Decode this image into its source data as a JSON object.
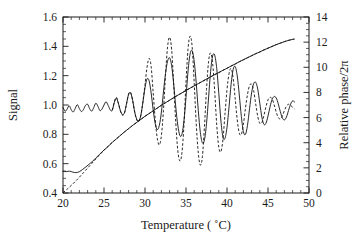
{
  "chart_data": {
    "type": "line",
    "title": "",
    "xlabel": "Temperature ( ˚C)",
    "ylabel": "Signal",
    "y2label": "Relative phase/2π",
    "xlim": [
      20,
      50
    ],
    "ylim": [
      0.4,
      1.6
    ],
    "y2lim": [
      0,
      14
    ],
    "xticks": [
      20,
      25,
      30,
      35,
      40,
      45,
      50
    ],
    "xtick_labels": [
      "20",
      "25",
      "30",
      "35",
      "40",
      "45",
      "50"
    ],
    "xminor_step": 1,
    "yticks": [
      0.4,
      0.6,
      0.8,
      1.0,
      1.2,
      1.4,
      1.6
    ],
    "ytick_labels": [
      "0.4",
      "0.6",
      "0.8",
      "1.0",
      "1.2",
      "1.4",
      "1.6"
    ],
    "yminor_step": 0.05,
    "y2ticks": [
      0,
      2,
      4,
      6,
      8,
      10,
      12,
      14
    ],
    "y2tick_labels": [
      "0",
      "2",
      "4",
      "6",
      "8",
      "10",
      "12",
      "14"
    ],
    "y2minor_step": 0.5,
    "grid": false,
    "legend": "none",
    "ticks_direction": "in",
    "series": [
      {
        "name": "signal-measured",
        "style": "solid",
        "axis": "left",
        "x": [
          20.0,
          20.25,
          20.5,
          20.75,
          21.0,
          21.25,
          21.5,
          21.75,
          22.0,
          22.25,
          22.5,
          22.75,
          23.0,
          23.25,
          23.5,
          23.75,
          24.0,
          24.25,
          24.5,
          24.75,
          25.0,
          25.25,
          25.5,
          25.75,
          26.0,
          26.25,
          26.5,
          26.75,
          27.0,
          27.25,
          27.5,
          27.75,
          28.0,
          28.25,
          28.5,
          28.75,
          29.0,
          29.25,
          29.5,
          29.75,
          30.0,
          30.25,
          30.5,
          30.75,
          31.0,
          31.25,
          31.5,
          31.75,
          32.0,
          32.25,
          32.5,
          32.75,
          33.0,
          33.25,
          33.5,
          33.75,
          34.0,
          34.25,
          34.5,
          34.75,
          35.0,
          35.25,
          35.5,
          35.75,
          36.0,
          36.25,
          36.5,
          36.75,
          37.0,
          37.25,
          37.5,
          37.75,
          38.0,
          38.25,
          38.5,
          38.75,
          39.0,
          39.25,
          39.5,
          39.75,
          40.0,
          40.25,
          40.5,
          40.75,
          41.0,
          41.25,
          41.5,
          41.75,
          42.0,
          42.25,
          42.5,
          42.75,
          43.0,
          43.25,
          43.5,
          43.75,
          44.0,
          44.25,
          44.5,
          44.75,
          45.0,
          45.25,
          45.5,
          45.75,
          46.0,
          46.25,
          46.5,
          46.75,
          47.0,
          47.25,
          47.5,
          47.75,
          48.0,
          48.25
        ],
        "y": [
          0.985,
          0.958,
          0.972,
          0.995,
          0.968,
          0.952,
          0.978,
          1.002,
          0.975,
          0.955,
          0.97,
          0.998,
          1.005,
          0.975,
          0.958,
          0.982,
          1.012,
          0.992,
          0.962,
          0.972,
          1.0,
          1.022,
          0.998,
          0.968,
          0.962,
          1.015,
          1.048,
          1.012,
          0.962,
          0.935,
          0.948,
          1.01,
          1.072,
          1.082,
          1.03,
          0.952,
          0.902,
          0.892,
          0.932,
          1.02,
          1.118,
          1.178,
          1.165,
          1.082,
          0.965,
          0.872,
          0.832,
          0.862,
          0.952,
          1.088,
          1.215,
          1.298,
          1.322,
          1.268,
          1.142,
          0.988,
          0.862,
          0.792,
          0.8,
          0.892,
          1.052,
          1.232,
          1.348,
          1.37,
          1.298,
          1.148,
          0.962,
          0.812,
          0.742,
          0.762,
          0.872,
          1.048,
          1.228,
          1.335,
          1.34,
          1.248,
          1.08,
          0.898,
          0.782,
          0.772,
          0.848,
          0.988,
          1.142,
          1.242,
          1.262,
          1.198,
          1.068,
          0.922,
          0.818,
          0.8,
          0.862,
          0.975,
          1.082,
          1.145,
          1.155,
          1.108,
          1.012,
          0.918,
          0.868,
          0.875,
          0.925,
          0.988,
          1.038,
          1.058,
          1.048,
          1.008,
          0.955,
          0.912,
          0.898,
          0.918,
          0.962,
          1.005,
          1.028,
          1.02
        ]
      },
      {
        "name": "signal-theory",
        "style": "dashed",
        "axis": "left",
        "x": [
          26.0,
          26.25,
          26.5,
          26.75,
          27.0,
          27.25,
          27.5,
          27.75,
          28.0,
          28.25,
          28.5,
          28.75,
          29.0,
          29.25,
          29.5,
          29.75,
          30.0,
          30.25,
          30.5,
          30.75,
          31.0,
          31.25,
          31.5,
          31.75,
          32.0,
          32.25,
          32.5,
          32.75,
          33.0,
          33.25,
          33.5,
          33.75,
          34.0,
          34.25,
          34.5,
          34.75,
          35.0,
          35.25,
          35.5,
          35.75,
          36.0,
          36.25,
          36.5,
          36.75,
          37.0,
          37.25,
          37.5,
          37.75,
          38.0,
          38.25,
          38.5,
          38.75,
          39.0,
          39.25,
          39.5,
          39.75,
          40.0,
          40.25,
          40.5,
          40.75,
          41.0,
          41.25,
          41.5,
          41.75,
          42.0,
          42.25,
          42.5,
          42.75,
          43.0,
          43.25,
          43.5,
          43.75,
          44.0,
          44.25,
          44.5,
          44.75,
          45.0,
          45.25,
          45.5,
          45.75,
          46.0,
          46.25,
          46.5,
          46.75,
          47.0,
          47.25,
          47.5,
          47.75,
          48.0,
          48.25
        ],
        "y": [
          0.965,
          1.018,
          1.052,
          1.012,
          0.958,
          0.93,
          0.945,
          1.008,
          1.075,
          1.085,
          1.028,
          0.948,
          0.898,
          0.888,
          0.93,
          1.025,
          1.138,
          1.258,
          1.318,
          1.262,
          1.082,
          0.898,
          0.772,
          0.728,
          0.792,
          0.962,
          1.2,
          1.395,
          1.462,
          1.378,
          1.142,
          0.882,
          0.69,
          0.618,
          0.672,
          0.862,
          1.155,
          1.385,
          1.47,
          1.398,
          1.152,
          0.872,
          0.672,
          0.59,
          0.648,
          0.852,
          1.105,
          1.295,
          1.355,
          1.282,
          1.095,
          0.862,
          0.712,
          0.682,
          0.762,
          0.935,
          1.105,
          1.215,
          1.248,
          1.182,
          1.042,
          0.898,
          0.808,
          0.8,
          0.868,
          0.978,
          1.072,
          1.132,
          1.142,
          1.098,
          1.008,
          0.922,
          0.875,
          0.88,
          0.928,
          0.988,
          1.035,
          1.052,
          1.042,
          1.002,
          0.952,
          0.915,
          0.905,
          0.925,
          0.962,
          0.992,
          1.005,
          0.998,
          0.985,
          0.972
        ]
      },
      {
        "name": "phase-measured",
        "style": "solid",
        "axis": "right",
        "x": [
          20.0,
          20.4,
          20.8,
          21.2,
          21.6,
          22.0,
          22.4,
          22.8,
          23.2,
          23.6,
          24.0,
          24.5,
          25.0,
          25.5,
          26.0,
          26.5,
          27.0,
          27.5,
          28.0,
          28.5,
          29.0,
          29.5,
          30.0,
          30.5,
          31.0,
          31.5,
          32.0,
          32.5,
          33.0,
          33.5,
          34.0,
          34.5,
          35.0,
          35.5,
          36.0,
          36.5,
          37.0,
          37.5,
          38.0,
          38.5,
          39.0,
          39.5,
          40.0,
          40.5,
          41.0,
          41.5,
          42.0,
          42.5,
          43.0,
          43.5,
          44.0,
          44.5,
          45.0,
          45.5,
          46.0,
          46.5,
          47.0,
          47.5,
          48.0,
          48.2
        ],
        "y": [
          1.72,
          1.7,
          1.74,
          1.66,
          1.62,
          1.7,
          1.88,
          2.08,
          2.3,
          2.52,
          2.78,
          3.1,
          3.42,
          3.7,
          4.02,
          4.3,
          4.58,
          4.86,
          5.12,
          5.38,
          5.62,
          5.86,
          6.1,
          6.32,
          6.54,
          6.76,
          6.98,
          7.18,
          7.38,
          7.58,
          7.78,
          7.96,
          8.16,
          8.34,
          8.52,
          8.7,
          8.88,
          9.06,
          9.24,
          9.42,
          9.58,
          9.76,
          9.92,
          10.1,
          10.26,
          10.44,
          10.6,
          10.76,
          10.92,
          11.08,
          11.22,
          11.38,
          11.52,
          11.66,
          11.8,
          11.92,
          12.04,
          12.14,
          12.22,
          12.24
        ]
      },
      {
        "name": "phase-theory",
        "style": "dashed",
        "axis": "right",
        "x": [
          20.0,
          20.5,
          21.0,
          21.5,
          22.0,
          22.5,
          23.0,
          23.5,
          24.0,
          24.5,
          25.0,
          25.5,
          26.0,
          26.5,
          27.0,
          27.5,
          28.0,
          28.5,
          29.0,
          29.5,
          30.0,
          30.5,
          31.0,
          31.5,
          32.0,
          32.5,
          33.0,
          33.5,
          34.0,
          34.5,
          35.0,
          35.5,
          36.0,
          36.5,
          37.0,
          37.5,
          38.0,
          38.5,
          39.0,
          39.5,
          40.0,
          40.5,
          41.0,
          41.5,
          42.0,
          42.5,
          43.0,
          43.5,
          44.0,
          44.5,
          45.0,
          45.5,
          46.0,
          46.5,
          47.0,
          47.5,
          48.0,
          48.2
        ],
        "y": [
          0.02,
          0.3,
          0.6,
          0.92,
          1.26,
          1.62,
          1.98,
          2.34,
          2.7,
          3.06,
          3.4,
          3.72,
          4.02,
          4.3,
          4.58,
          4.86,
          5.12,
          5.38,
          5.62,
          5.86,
          6.1,
          6.32,
          6.54,
          6.76,
          6.98,
          7.18,
          7.38,
          7.58,
          7.78,
          7.96,
          8.16,
          8.34,
          8.52,
          8.7,
          8.88,
          9.06,
          9.24,
          9.42,
          9.58,
          9.76,
          9.92,
          10.1,
          10.26,
          10.44,
          10.6,
          10.76,
          10.92,
          11.08,
          11.22,
          11.38,
          11.52,
          11.66,
          11.8,
          11.92,
          12.04,
          12.14,
          12.22,
          12.24
        ]
      }
    ]
  }
}
